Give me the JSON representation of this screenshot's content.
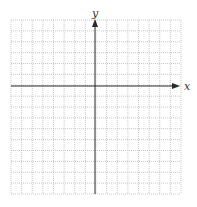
{
  "grid": {
    "left": 11,
    "top": 20,
    "right": 181,
    "bottom": 194,
    "columns": 16,
    "rows": 16,
    "line_color": "#b8b8b8",
    "dash": "1,1"
  },
  "axes": {
    "color": "#2a2a2a",
    "x_axis_y": 86,
    "y_axis_x": 95,
    "x_label": "x",
    "y_label": "y"
  }
}
